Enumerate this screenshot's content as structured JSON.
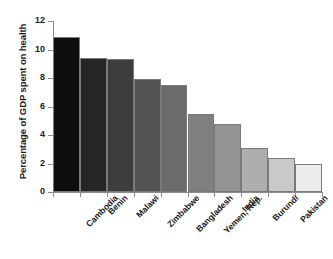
{
  "chart_data": {
    "type": "bar",
    "title": "",
    "subtitle": "",
    "xlabel": "",
    "ylabel": "Percentage of GDP spent on health",
    "categories": [
      "Cambodia",
      "Benin",
      "Malawi",
      "Zimbabwe",
      "Bangladesh",
      "Yemen, Rep.",
      "India",
      "Burundi",
      "Pakistan",
      "Congo, Dem. Rep."
    ],
    "values": [
      10.9,
      9.4,
      9.3,
      7.9,
      7.5,
      5.5,
      4.8,
      3.1,
      2.4,
      2.0
    ],
    "ylim": [
      0,
      12
    ],
    "yticks": [
      0,
      2,
      4,
      6,
      8,
      10,
      12
    ],
    "ytick_labels": [
      "0",
      "2",
      "4",
      "6",
      "8",
      "10",
      "12"
    ],
    "grid": false,
    "legend": "none",
    "bar_colors": [
      "#0d0d0d",
      "#262626",
      "#3d3d3d",
      "#545454",
      "#6b6b6b",
      "#7f7f7f",
      "#949494",
      "#aeaeae",
      "#c9c9c9",
      "#ececec"
    ],
    "bar_edge_color": "#7a7a7a",
    "axis_color": "#8c8c8c",
    "background": "#ffffff",
    "text_color": "#1a1a1a"
  }
}
